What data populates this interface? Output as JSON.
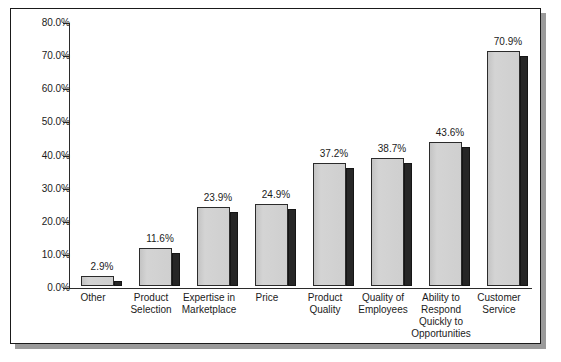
{
  "chart_data": {
    "type": "bar",
    "title": "",
    "subtitle": "",
    "xlabel": "",
    "ylabel": "",
    "ylim": [
      0,
      80
    ],
    "grid": false,
    "legend": "none",
    "orientation": "vertical",
    "value_suffix": "%",
    "categories": [
      "Other",
      "Product Selection",
      "Expertise in Marketplace",
      "Price",
      "Product Quality",
      "Quality of Employees",
      "Ability to Respond Quickly to Opportunities",
      "Customer Service"
    ],
    "category_lines": [
      [
        "Other"
      ],
      [
        "Product",
        "Selection"
      ],
      [
        "Expertise in",
        "Marketplace"
      ],
      [
        "Price"
      ],
      [
        "Product",
        "Quality"
      ],
      [
        "Quality of",
        "Employees"
      ],
      [
        "Ability to",
        "Respond",
        "Quickly to",
        "Opportunities"
      ],
      [
        "Customer",
        "Service"
      ]
    ],
    "values": [
      2.9,
      11.6,
      23.9,
      24.9,
      37.2,
      38.7,
      43.6,
      70.9
    ],
    "data_labels": [
      "2.9%",
      "11.6%",
      "23.9%",
      "24.9%",
      "37.2%",
      "38.7%",
      "43.6%",
      "70.9%"
    ],
    "y_ticks": [
      0,
      10,
      20,
      30,
      40,
      50,
      60,
      70,
      80
    ],
    "y_tick_labels": [
      "0.0%",
      "10.0%",
      "20.0%",
      "30.0%",
      "40.0%",
      "50.0%",
      "60.0%",
      "70.0%",
      "80.0%"
    ]
  },
  "colors": {
    "bar_face": "#cdcdcd",
    "bar_side": "#272727",
    "bar_outline": "#2b2b2b",
    "axis": "#2b2b2b",
    "text": "#1b1b1b",
    "panel_background": "#ffffff",
    "panel_border": "#1a1a1a",
    "panel_shadow": "#9a9a9a",
    "page_background": "#ffffff"
  }
}
